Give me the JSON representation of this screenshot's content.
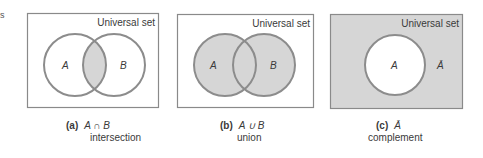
{
  "corner_mark": "s",
  "colors": {
    "box_border": "#8a8a8a",
    "circle_stroke": "#8c8c8c",
    "shade": "#d6d6d6",
    "white": "#ffffff",
    "text": "#3a3a3a"
  },
  "panels": [
    {
      "id": "a",
      "universal_label": "Universal set",
      "set_labels": [
        "A",
        "B"
      ],
      "caption_tag": "(a)",
      "caption_expr": "A ∩ B",
      "caption_word": "intersection"
    },
    {
      "id": "b",
      "universal_label": "Universal set",
      "set_labels": [
        "A",
        "B"
      ],
      "caption_tag": "(b)",
      "caption_expr": "A ∪ B",
      "caption_word": "union"
    },
    {
      "id": "c",
      "universal_label": "Universal set",
      "set_labels": [
        "A",
        "Ā"
      ],
      "caption_tag": "(c)",
      "caption_expr": "Ā",
      "caption_word": "complement"
    }
  ]
}
